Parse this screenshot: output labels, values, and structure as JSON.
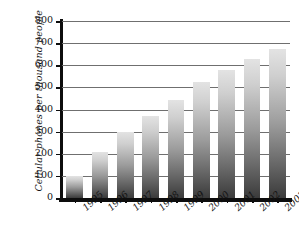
{
  "chart_data": {
    "type": "bar",
    "title": "",
    "xlabel": "",
    "ylabel": "Cellular phones per thousand people",
    "categories": [
      "1995",
      "1996",
      "1997",
      "1998",
      "1999",
      "2000",
      "2001",
      "2002",
      "2003"
    ],
    "values": [
      100,
      210,
      300,
      370,
      445,
      525,
      578,
      630,
      675
    ],
    "series": [
      {
        "name": "Cellular phones per thousand people",
        "values": [
          100,
          210,
          300,
          370,
          445,
          525,
          578,
          630,
          675
        ]
      }
    ],
    "ylim": [
      0,
      800
    ],
    "yticks": [
      0,
      100,
      200,
      300,
      400,
      500,
      600,
      700,
      800
    ],
    "ytick_labels": [
      "0",
      "100",
      "200",
      "300",
      "400",
      "500",
      "600",
      "700",
      "800"
    ],
    "grid": "horizontal",
    "legend": "none",
    "bar_style": "vertical-gradient-gray",
    "colors": {
      "bar_top": "#e3e3e3",
      "bar_bottom": "#3b3b3b",
      "gridline": "#6f6f6f",
      "axis": "#0d0d0d",
      "text": "#131313",
      "background": "#ffffff"
    }
  }
}
